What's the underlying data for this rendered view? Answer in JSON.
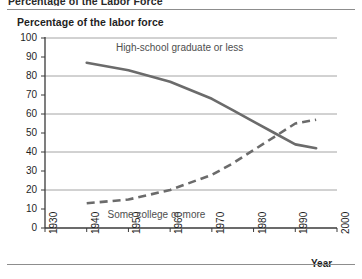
{
  "figure": {
    "cropped_heading": "Percentage of the Labor Force",
    "panel_title": "Percentage of the labor force",
    "x_axis_name": "Year",
    "colors": {
      "line": "#6b6b6b",
      "grid": "#9a9a9a",
      "axis": "#3a3a3a",
      "text": "#1f1f1f",
      "label_text": "#4e4e4e",
      "background": "#ffffff"
    }
  },
  "chart_data": {
    "type": "line",
    "title": "Percentage of the labor force",
    "xlabel": "Year",
    "ylabel": "",
    "xlim": [
      1930,
      2000
    ],
    "ylim": [
      0,
      100
    ],
    "grid": true,
    "grid_y_values": [
      100,
      80,
      60,
      40,
      20,
      0
    ],
    "xticks": [
      1930,
      1940,
      1950,
      1960,
      1970,
      1980,
      1990,
      2000
    ],
    "xticklabels": [
      "1930",
      "1940",
      "1950",
      "1960",
      "1970",
      "1980",
      "1990",
      "2000"
    ],
    "yticks": [
      0,
      10,
      20,
      30,
      40,
      50,
      60,
      70,
      80,
      90,
      100
    ],
    "yticklabels": [
      "0",
      "10",
      "20",
      "30",
      "40",
      "50",
      "60",
      "70",
      "80",
      "90",
      "100"
    ],
    "legend_position": "inline-annotation",
    "series": [
      {
        "name": "High-school graduate or less",
        "style": "solid",
        "color": "#6b6b6b",
        "x": [
          1940,
          1950,
          1960,
          1970,
          1975,
          1980,
          1985,
          1990,
          1995
        ],
        "values": [
          87,
          83,
          77,
          68,
          62,
          56,
          50,
          44,
          42
        ]
      },
      {
        "name": "Some college or more",
        "style": "dashed",
        "color": "#6b6b6b",
        "x": [
          1940,
          1950,
          1960,
          1970,
          1975,
          1980,
          1985,
          1990,
          1995
        ],
        "values": [
          13,
          15,
          20,
          28,
          34,
          41,
          48,
          55,
          57
        ]
      }
    ],
    "annotations": [
      {
        "text": "High-school graduate or less",
        "x": 1947,
        "y": 95
      },
      {
        "text": "Some college or more",
        "x": 1945,
        "y": 7
      }
    ]
  }
}
